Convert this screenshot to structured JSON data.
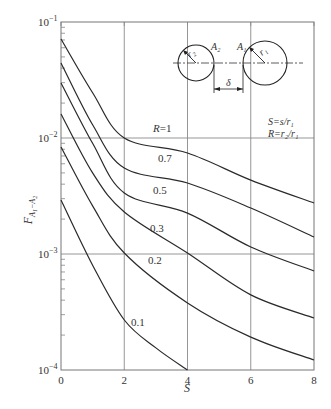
{
  "chart_data": {
    "type": "line",
    "title": "",
    "xlabel": "S",
    "ylabel": "F_{A1-A2}",
    "xscale": "linear",
    "yscale": "log",
    "xlim": [
      0,
      8
    ],
    "ylim": [
      0.0001,
      0.1
    ],
    "grid": true,
    "x_ticks": [
      "0",
      "2",
      "4",
      "6",
      "8"
    ],
    "y_ticks": [
      {
        "base": "10",
        "exp": "−1",
        "value": 0.1
      },
      {
        "base": "10",
        "exp": "−2",
        "value": 0.01
      },
      {
        "base": "10",
        "exp": "−3",
        "value": 0.001
      },
      {
        "base": "10",
        "exp": "−4",
        "value": 0.0001
      }
    ],
    "x": [
      0,
      1,
      2,
      4,
      6,
      8
    ],
    "series": [
      {
        "name": "R=1",
        "label": "R=1",
        "points": [
          [
            0,
            0.0713
          ],
          [
            1,
            0.0246
          ],
          [
            2,
            0.01
          ],
          [
            4,
            0.00743
          ],
          [
            6,
            0.00434
          ],
          [
            8,
            0.00275
          ]
        ]
      },
      {
        "name": "0.7",
        "label": "0.7",
        "points": [
          [
            0,
            0.0443
          ],
          [
            1,
            0.013
          ],
          [
            2,
            0.0055
          ],
          [
            4,
            0.00409
          ],
          [
            6,
            0.00249
          ],
          [
            8,
            0.0014
          ]
        ]
      },
      {
        "name": "0.5",
        "label": "0.5",
        "points": [
          [
            0,
            0.0298
          ],
          [
            1,
            0.009
          ],
          [
            2,
            0.00336
          ],
          [
            4,
            0.00225
          ],
          [
            6,
            0.00115
          ],
          [
            8,
            0.000713
          ]
        ]
      },
      {
        "name": "0.3",
        "label": "0.3",
        "points": [
          [
            0,
            0.0161
          ],
          [
            1,
            0.005
          ],
          [
            2,
            0.0023
          ],
          [
            4,
            0.00102
          ],
          [
            6,
            0.000444
          ],
          [
            8,
            0.000281
          ]
        ]
      },
      {
        "name": "0.2",
        "label": "0.2",
        "points": [
          [
            0,
            0.00836
          ],
          [
            1,
            0.0026
          ],
          [
            2,
            0.00102
          ],
          [
            4,
            0.000379
          ],
          [
            6,
            0.000192
          ],
          [
            8,
            0.000122
          ]
        ]
      },
      {
        "name": "0.1",
        "label": "0.1",
        "points": [
          [
            0,
            0.00292
          ],
          [
            1,
            0.0008
          ],
          [
            2,
            0.00027
          ],
          [
            3,
            0.000155
          ],
          [
            4,
            0.0001
          ]
        ]
      }
    ],
    "annotations": {
      "definitions": [
        "S=s/r₁",
        "R=r₂/r₁"
      ],
      "inset": {
        "left_circle_label": "A₂",
        "left_radius_label": "r₂",
        "right_circle_label": "A₁",
        "right_radius_label": "r₁",
        "gap_label": "δ"
      }
    }
  },
  "style": {
    "curve_color": "#2a2a2a",
    "grid_color": "#8a8a8a",
    "axis_color": "#555555"
  }
}
